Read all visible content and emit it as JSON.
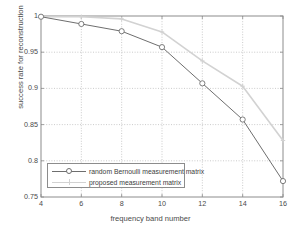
{
  "chart_data": {
    "type": "line",
    "title": "",
    "xlabel": "frequency band number",
    "ylabel": "success rate for reconstruction",
    "xlim": [
      4,
      16
    ],
    "ylim": [
      0.75,
      1.0
    ],
    "xticks": [
      4,
      6,
      8,
      10,
      12,
      14,
      16
    ],
    "xtick_labels": [
      "4",
      "6",
      "8",
      "10",
      "12",
      "14",
      "16"
    ],
    "yticks": [
      0.75,
      0.8,
      0.85,
      0.9,
      0.95,
      1
    ],
    "ytick_labels": [
      "0.75",
      "0.8",
      "0.85",
      "0.9",
      "0.95",
      "1"
    ],
    "grid": true,
    "grid_style": "dotted",
    "legend_position": "lower left",
    "x": [
      4,
      6,
      8,
      10,
      12,
      14,
      16
    ],
    "series": [
      {
        "name": "random Bernoulli measurement matrix",
        "color": "#6e6e6e",
        "marker": "circle",
        "values": [
          0.999,
          0.989,
          0.979,
          0.957,
          0.907,
          0.857,
          0.772
        ]
      },
      {
        "name": "proposed measurement matrix",
        "color": "#d2d2d2",
        "marker": "plus",
        "values": [
          0.999,
          0.999,
          0.996,
          0.978,
          0.938,
          0.903,
          0.828
        ]
      }
    ]
  },
  "legend": {
    "entries": [
      {
        "label": "random Bernoulli measurement matrix"
      },
      {
        "label": "proposed measurement matrix"
      }
    ]
  },
  "axes": {
    "box_color": "#8c8c8c",
    "grid_color": "#b4b4b4",
    "tick_text_color": "#4a4a4a"
  }
}
